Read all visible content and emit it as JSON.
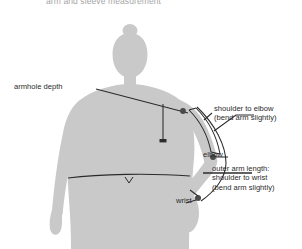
{
  "diagram": {
    "title": "arm and sleeve measurement",
    "colors": {
      "body_fill": "#c9c9c9",
      "body_fill_shadow": "#bdbdbd",
      "background": "#ffffff",
      "line": "#2b2b2b",
      "label_text": "#2b2b2b",
      "title_text": "#58585a"
    }
  },
  "labels": {
    "armhole_depth": "armhole depth",
    "shoulder_to_elbow_1": "shoulder to elbow",
    "shoulder_to_elbow_2": "(bend arm slightly)",
    "elbow": "elbow",
    "outer_arm_1": "outer arm length:",
    "outer_arm_2": "shoulder to wrist",
    "outer_arm_3": "(bend arm slightly)",
    "wrist": "wrist"
  }
}
